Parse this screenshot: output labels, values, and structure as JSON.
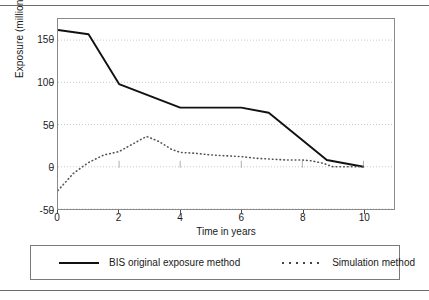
{
  "figure": {
    "ylabel": "Exposure (million $ U.S.)",
    "xlabel": "Time in years"
  },
  "axis": {
    "yticks": [
      "-50",
      "0",
      "50",
      "100",
      "150"
    ],
    "xticks": [
      "0",
      "2",
      "4",
      "6",
      "8",
      "10"
    ]
  },
  "legend": {
    "series_solid_label": "BIS original exposure method",
    "series_dotted_label": "Simulation method",
    "swatch_solid": "solid-line-swatch",
    "swatch_dotted": "dotted-line-swatch"
  },
  "chart_data": {
    "type": "line",
    "title": "",
    "xlabel": "Time in years",
    "ylabel": "Exposure (million $ U.S.)",
    "xlim": [
      0,
      11
    ],
    "ylim": [
      -50,
      175
    ],
    "xticks": [
      0,
      2,
      4,
      6,
      8,
      10
    ],
    "yticks": [
      -50,
      0,
      50,
      100,
      150
    ],
    "grid": "horizontal-dotted",
    "legend_position": "below-plot",
    "series": [
      {
        "name": "BIS original exposure method",
        "style": "solid",
        "color": "#111111",
        "x": [
          0,
          1,
          2,
          3,
          4,
          5,
          6,
          6.9,
          8.8,
          10
        ],
        "values": [
          162,
          157,
          98,
          84,
          70,
          70,
          70,
          64,
          8,
          0
        ]
      },
      {
        "name": "Simulation method",
        "style": "dotted",
        "color": "#555555",
        "x": [
          0,
          0.5,
          0.8,
          1,
          1.5,
          2,
          2.5,
          2.9,
          3.3,
          3.7,
          4,
          4.5,
          5,
          5.5,
          6,
          6.5,
          7,
          7.5,
          8,
          8.3,
          8.7,
          9,
          10
        ],
        "values": [
          -28,
          -8,
          0,
          5,
          14,
          18,
          28,
          36,
          30,
          21,
          17,
          16,
          14,
          13,
          12,
          10,
          9,
          8,
          8,
          7,
          4,
          0,
          0
        ]
      }
    ]
  }
}
